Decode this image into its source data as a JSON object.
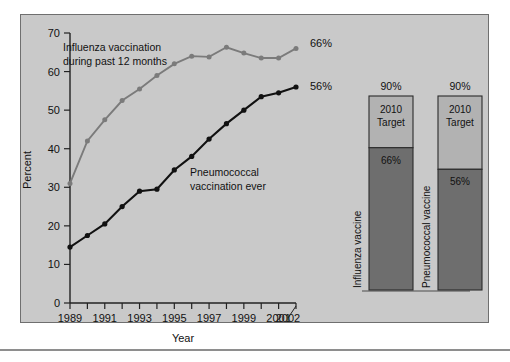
{
  "figure": {
    "panel_bg": "#c9c9c9",
    "frame_border": "#6f6f6f"
  },
  "chart_data": {
    "type": "line",
    "title": "",
    "xlabel": "Year",
    "ylabel": "Percent",
    "xlim": [
      1989,
      2002
    ],
    "ylim": [
      0,
      70
    ],
    "ytick_labels": [
      "0",
      "10",
      "20",
      "30",
      "40",
      "50",
      "60",
      "70"
    ],
    "ytick_values": [
      0,
      10,
      20,
      30,
      40,
      50,
      60,
      70
    ],
    "xtick_values": [
      1989,
      1990,
      1991,
      1992,
      1993,
      1994,
      1995,
      1996,
      1997,
      1998,
      1999,
      2000,
      2001,
      2002
    ],
    "xtick_labels": [
      "1989",
      "1991",
      "1993",
      "1995",
      "1997",
      "1999",
      "2001",
      "2002"
    ],
    "xtick_labeled_values": [
      1989,
      1991,
      1993,
      1995,
      1997,
      1999,
      2001,
      2002
    ],
    "grid": false,
    "legend_position": "inline-annotations",
    "x": [
      1989,
      1990,
      1991,
      1992,
      1993,
      1994,
      1995,
      1996,
      1997,
      1998,
      1999,
      2000,
      2001,
      2002
    ],
    "series": [
      {
        "name": "Influenza vaccination during past 12 months",
        "color": "#7b7b7b",
        "values": [
          31,
          42,
          47.5,
          52.5,
          55.5,
          59,
          62,
          64,
          63.8,
          66.3,
          64.8,
          63.5,
          63.5,
          66
        ],
        "end_label": "66%"
      },
      {
        "name": "Pneumococcal vaccination ever",
        "color": "#111111",
        "values": [
          14.5,
          17.5,
          20.5,
          25,
          29,
          29.5,
          34.5,
          38,
          42.5,
          46.5,
          50,
          53.5,
          54.5,
          56
        ],
        "end_label": "56%"
      }
    ],
    "annotations": [
      {
        "id": "influenza-label",
        "line1": "Influenza vaccination",
        "line2": "during past 12 months"
      },
      {
        "id": "pneumococcal-label",
        "line1": "Pneumococcal",
        "line2": "vaccination ever"
      }
    ]
  },
  "bar_panel": {
    "type": "bar",
    "axis_max": 90,
    "bars": [
      {
        "category": "Influenza vaccine",
        "top_label": "90%",
        "target_line1": "2010",
        "target_line2": "Target",
        "achieved_value": 66,
        "achieved_label": "66%",
        "target_value": 90
      },
      {
        "category": "Pneumococcal vaccine",
        "top_label": "90%",
        "target_line1": "2010",
        "target_line2": "Target",
        "achieved_value": 56,
        "achieved_label": "56%",
        "target_value": 90
      }
    ],
    "colors": {
      "achieved": "#6e6e6e",
      "target": "#b2b2b2",
      "outline": "#2b2b2b",
      "baseline": "#7a7a7a"
    }
  }
}
